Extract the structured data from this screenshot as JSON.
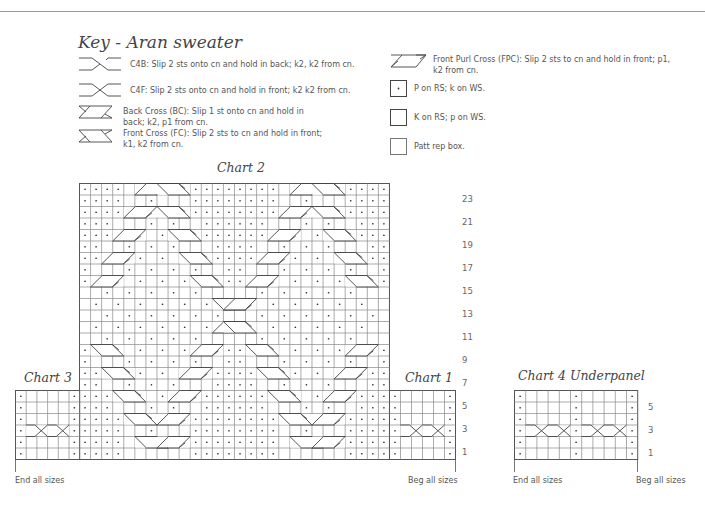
{
  "key": {
    "title": "Key - Aran sweater",
    "items": [
      {
        "symbol": "c4b-icon",
        "text": "C4B:  Slip 2 sts onto cn and hold in back; k2, k2 from cn."
      },
      {
        "symbol": "c4f-icon",
        "text": "C4F: Slip 2 sts onto cn and hold in front; k2 k2 from cn."
      },
      {
        "symbol": "back-cross-icon",
        "text": "Back Cross (BC): Slip 1 st onto cn and hold in back; k2, p1 from cn."
      },
      {
        "symbol": "front-cross-icon",
        "text": "Front Cross (FC): Slip 2 sts to cn and hold in front; k1, k2 from cn."
      },
      {
        "symbol": "front-purl-cross-icon",
        "text": "Front Purl Cross (FPC): Slip 2 sts to cn and hold in front; p1, k2 from cn."
      },
      {
        "symbol": "purl-dot-icon",
        "text": "P on RS; k on WS."
      },
      {
        "symbol": "knit-box-icon",
        "text": "K on RS; p on WS."
      },
      {
        "symbol": "patt-rep-box-icon",
        "text": "Patt rep box."
      }
    ]
  },
  "charts": {
    "chart2": {
      "title": "Chart 2",
      "cols": 28,
      "rows": 24
    },
    "chart3": {
      "title": "Chart 3",
      "cols": 6,
      "rows": 6
    },
    "chart1": {
      "title": "Chart 1",
      "cols": 6,
      "rows": 6
    },
    "chart4": {
      "title": "Chart 4 Underpanel",
      "cols": 11,
      "rows": 6
    }
  },
  "row_numbers": {
    "main": [
      "23",
      "21",
      "19",
      "17",
      "15",
      "13",
      "11",
      "9",
      "7",
      "5",
      "3",
      "1"
    ],
    "underpanel": [
      "5",
      "3",
      "1"
    ]
  },
  "footer": {
    "end_left": "End all sizes",
    "beg_main": "Beg all sizes",
    "end_under": "End all sizes",
    "beg_under": "Beg all sizes"
  },
  "chart_data": {
    "type": "table",
    "title": "Key - Aran sweater",
    "charts": [
      {
        "name": "Chart 3",
        "cols": 6,
        "rows": 6,
        "row_labels": [],
        "notes": "P col 1 and 6, knit center, C4B/C4F cables on row 3"
      },
      {
        "name": "Chart 2",
        "cols": 28,
        "rows": 24,
        "row_labels": [
          1,
          3,
          5,
          7,
          9,
          11,
          13,
          15,
          17,
          19,
          21,
          23
        ],
        "notes": "Diamond/cable Aran pattern with purl background"
      },
      {
        "name": "Chart 1",
        "cols": 6,
        "rows": 6,
        "row_labels": [
          1,
          3,
          5
        ],
        "notes": "P col 1 and 6, knit center, cables on row 3"
      },
      {
        "name": "Chart 4 Underpanel",
        "cols": 11,
        "rows": 6,
        "row_labels": [
          1,
          3,
          5
        ],
        "notes": "P cols 1, 6, 11; knit 4-st panels with cables on row 3"
      }
    ]
  }
}
